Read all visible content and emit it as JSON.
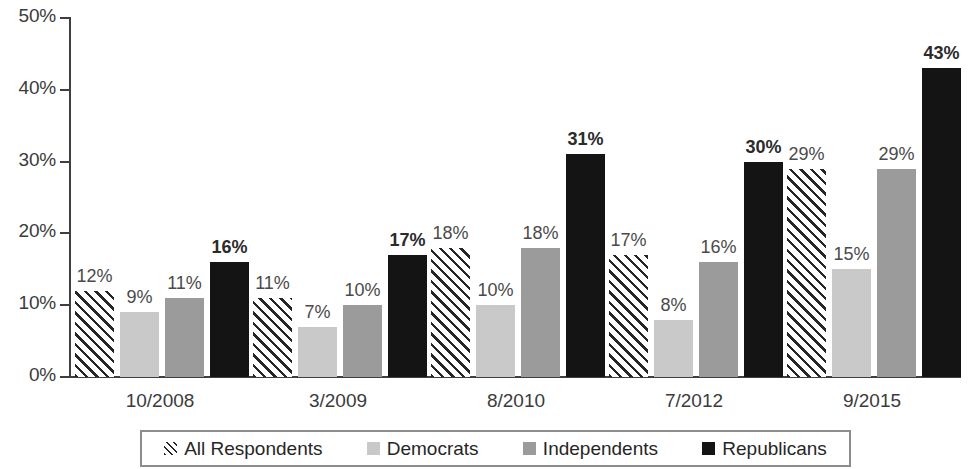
{
  "chart_data": {
    "type": "bar",
    "title": "",
    "subtitle": "",
    "xlabel": "",
    "ylabel": "",
    "ylim": [
      0,
      50
    ],
    "yticks": [
      "0%",
      "10%",
      "20%",
      "30%",
      "40%",
      "50%"
    ],
    "ytick_values": [
      0,
      10,
      20,
      30,
      40,
      50
    ],
    "grid": false,
    "legend_position": "bottom",
    "categories": [
      "10/2008",
      "3/2009",
      "8/2010",
      "7/2012",
      "9/2015"
    ],
    "series": [
      {
        "name": "All Respondents",
        "pattern": "diagonal-hatch",
        "color": "#ffffff",
        "values": [
          12,
          11,
          18,
          17,
          29
        ],
        "labels": [
          "12%",
          "11%",
          "18%",
          "17%",
          "29%"
        ],
        "label_bold": false
      },
      {
        "name": "Democrats",
        "pattern": "solid",
        "color": "#c9c9c9",
        "values": [
          9,
          7,
          10,
          8,
          15
        ],
        "labels": [
          "9%",
          "7%",
          "10%",
          "8%",
          "15%"
        ],
        "label_bold": false
      },
      {
        "name": "Independents",
        "pattern": "solid",
        "color": "#9b9b9b",
        "values": [
          11,
          10,
          18,
          16,
          29
        ],
        "labels": [
          "11%",
          "10%",
          "18%",
          "16%",
          "29%"
        ],
        "label_bold": false
      },
      {
        "name": "Republicans",
        "pattern": "solid",
        "color": "#141414",
        "values": [
          16,
          17,
          31,
          30,
          43
        ],
        "labels": [
          "16%",
          "17%",
          "31%",
          "30%",
          "43%"
        ],
        "label_bold": true
      }
    ]
  },
  "legend": {
    "items": [
      {
        "label": "All Respondents",
        "swatch": "hatch-swatch-icon"
      },
      {
        "label": "Democrats",
        "swatch": "light-gray-swatch-icon"
      },
      {
        "label": "Independents",
        "swatch": "mid-gray-swatch-icon"
      },
      {
        "label": "Republicans",
        "swatch": "black-swatch-icon"
      }
    ]
  }
}
